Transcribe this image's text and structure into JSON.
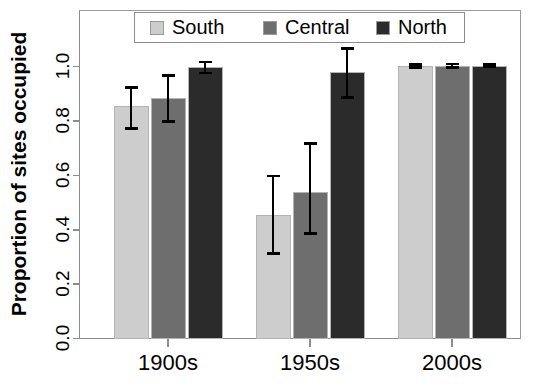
{
  "chart_data": {
    "type": "bar",
    "title": "",
    "subtitle": "",
    "xlabel": "",
    "ylabel": "Proportion of sites occupied",
    "categories": [
      "1900s",
      "1950s",
      "2000s"
    ],
    "ylim": [
      0.0,
      1.08
    ],
    "ytick_values": [
      0.0,
      0.2,
      0.4,
      0.6,
      0.8,
      1.0
    ],
    "ytick_labels": [
      "0.0",
      "0.2",
      "0.4",
      "0.6",
      "0.8",
      "1.0"
    ],
    "grid": false,
    "legend_position": "top-center",
    "error_bars": "vertical-with-caps",
    "series": [
      {
        "name": "South",
        "color": "#cdcdcd",
        "values": [
          0.85,
          0.45,
          1.0
        ],
        "err_low": [
          0.77,
          0.31,
          0.995
        ],
        "err_high": [
          0.92,
          0.595,
          1.005
        ]
      },
      {
        "name": "Central",
        "color": "#6e6e6e",
        "values": [
          0.88,
          0.535,
          1.0
        ],
        "err_low": [
          0.795,
          0.385,
          0.995
        ],
        "err_high": [
          0.965,
          0.715,
          1.008
        ]
      },
      {
        "name": "North",
        "color": "#2b2b2b",
        "values": [
          0.995,
          0.975,
          1.0
        ],
        "err_low": [
          0.975,
          0.885,
          0.998
        ],
        "err_high": [
          1.015,
          1.065,
          1.006
        ]
      }
    ]
  },
  "legend": {
    "entries": [
      {
        "label": "South",
        "color": "#cdcdcd"
      },
      {
        "label": "Central",
        "color": "#6e6e6e"
      },
      {
        "label": "North",
        "color": "#2b2b2b"
      }
    ]
  },
  "axes": {
    "y_axis_label": "Proportion of sites occupied",
    "y_tick_labels": [
      "0.0",
      "0.2",
      "0.4",
      "0.6",
      "0.8",
      "1.0"
    ],
    "x_tick_labels": [
      "1900s",
      "1950s",
      "2000s"
    ]
  }
}
